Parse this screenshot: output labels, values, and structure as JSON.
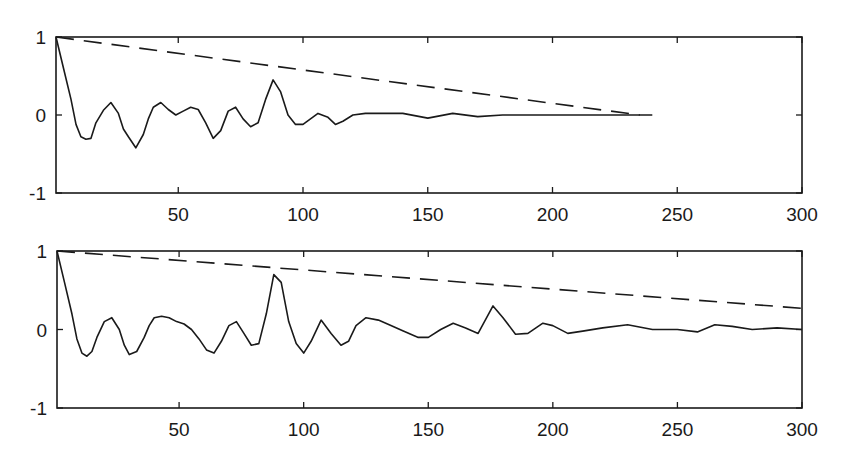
{
  "chart_data": [
    {
      "type": "line",
      "title": "",
      "xlabel": "",
      "ylabel": "",
      "xlim": [
        1,
        300
      ],
      "ylim": [
        -1,
        1
      ],
      "xticks": [
        50,
        100,
        150,
        200,
        250,
        300
      ],
      "yticks": [
        -1,
        0,
        1
      ],
      "grid": false,
      "legend": null,
      "series": [
        {
          "name": "autocorrelation",
          "style": "solid",
          "x": [
            1,
            4,
            7,
            9,
            11,
            13,
            15,
            17,
            20,
            23,
            26,
            28,
            30,
            33,
            36,
            38,
            40,
            43,
            46,
            49,
            52,
            55,
            58,
            61,
            64,
            67,
            70,
            73,
            76,
            79,
            82,
            85,
            88,
            91,
            94,
            97,
            100,
            103,
            106,
            110,
            113,
            116,
            120,
            125,
            130,
            140,
            150,
            160,
            170,
            180,
            200,
            220,
            240
          ],
          "values": [
            1.0,
            0.6,
            0.2,
            -0.12,
            -0.28,
            -0.31,
            -0.3,
            -0.1,
            0.06,
            0.16,
            0.02,
            -0.18,
            -0.28,
            -0.42,
            -0.25,
            -0.05,
            0.1,
            0.16,
            0.07,
            0.0,
            0.05,
            0.1,
            0.07,
            -0.1,
            -0.3,
            -0.2,
            0.05,
            0.1,
            -0.05,
            -0.15,
            -0.1,
            0.2,
            0.45,
            0.3,
            0.0,
            -0.12,
            -0.12,
            -0.05,
            0.02,
            -0.03,
            -0.12,
            -0.08,
            0.0,
            0.02,
            0.02,
            0.02,
            -0.04,
            0.02,
            -0.02,
            0.0,
            0.0,
            0.0,
            0.0
          ]
        },
        {
          "name": "confidence bound",
          "style": "dashed",
          "x": [
            1,
            235
          ],
          "values": [
            1.0,
            0.0
          ]
        }
      ]
    },
    {
      "type": "line",
      "title": "",
      "xlabel": "",
      "ylabel": "",
      "xlim": [
        1,
        300
      ],
      "ylim": [
        -1,
        1
      ],
      "xticks": [
        50,
        100,
        150,
        200,
        250,
        300
      ],
      "yticks": [
        -1,
        0,
        1
      ],
      "grid": false,
      "legend": null,
      "series": [
        {
          "name": "autocorrelation",
          "style": "solid",
          "x": [
            1,
            4,
            7,
            9,
            11,
            13,
            15,
            17,
            20,
            23,
            26,
            28,
            30,
            33,
            36,
            38,
            40,
            43,
            46,
            49,
            52,
            55,
            58,
            61,
            64,
            67,
            70,
            73,
            76,
            79,
            82,
            85,
            88,
            91,
            94,
            97,
            100,
            103,
            107,
            111,
            115,
            118,
            121,
            125,
            130,
            135,
            140,
            146,
            150,
            155,
            160,
            165,
            170,
            176,
            180,
            185,
            190,
            196,
            200,
            206,
            212,
            220,
            230,
            240,
            250,
            258,
            265,
            272,
            280,
            290,
            300
          ],
          "values": [
            1.0,
            0.6,
            0.2,
            -0.12,
            -0.3,
            -0.34,
            -0.28,
            -0.1,
            0.1,
            0.15,
            0.0,
            -0.2,
            -0.32,
            -0.28,
            -0.1,
            0.05,
            0.15,
            0.17,
            0.15,
            0.1,
            0.07,
            0.0,
            -0.12,
            -0.26,
            -0.3,
            -0.15,
            0.05,
            0.1,
            -0.05,
            -0.2,
            -0.18,
            0.2,
            0.7,
            0.6,
            0.1,
            -0.18,
            -0.3,
            -0.15,
            0.12,
            -0.05,
            -0.2,
            -0.15,
            0.05,
            0.15,
            0.12,
            0.05,
            -0.02,
            -0.1,
            -0.1,
            0.0,
            0.08,
            0.02,
            -0.05,
            0.3,
            0.15,
            -0.06,
            -0.05,
            0.08,
            0.05,
            -0.05,
            -0.02,
            0.02,
            0.06,
            0.0,
            0.0,
            -0.03,
            0.06,
            0.04,
            0.0,
            0.02,
            0.0
          ]
        },
        {
          "name": "confidence bound",
          "style": "dashed",
          "x": [
            1,
            300
          ],
          "values": [
            1.0,
            0.27
          ]
        }
      ]
    }
  ]
}
